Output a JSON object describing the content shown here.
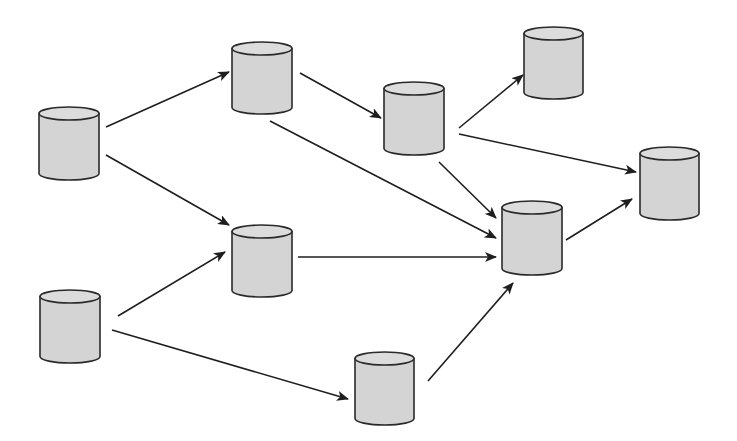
{
  "diagram": {
    "type": "directed-graph",
    "node_shape": "database-cylinder",
    "colors": {
      "background": "#ffffff",
      "fill": "#d4d4d4",
      "top_fill": "#dcdcdc",
      "stroke": "#2a2a2a",
      "edge": "#1e1e1e"
    },
    "nodes": [
      {
        "id": "n1",
        "x": 39,
        "y": 107,
        "w": 60,
        "h": 73
      },
      {
        "id": "n2",
        "x": 40,
        "y": 290,
        "w": 60,
        "h": 73
      },
      {
        "id": "n3",
        "x": 232,
        "y": 42,
        "w": 60,
        "h": 72
      },
      {
        "id": "n4",
        "x": 232,
        "y": 225,
        "w": 60,
        "h": 72
      },
      {
        "id": "n5",
        "x": 384,
        "y": 82,
        "w": 60,
        "h": 73
      },
      {
        "id": "n6",
        "x": 355,
        "y": 352,
        "w": 59,
        "h": 73
      },
      {
        "id": "n7",
        "x": 524,
        "y": 27,
        "w": 59,
        "h": 72
      },
      {
        "id": "n8",
        "x": 502,
        "y": 201,
        "w": 60,
        "h": 74
      },
      {
        "id": "n9",
        "x": 640,
        "y": 147,
        "w": 59,
        "h": 73
      }
    ],
    "edges": [
      {
        "from": "n1",
        "to": "n3",
        "x1": 106,
        "y1": 127,
        "x2": 229,
        "y2": 72
      },
      {
        "from": "n1",
        "to": "n4",
        "x1": 106,
        "y1": 155,
        "x2": 229,
        "y2": 225
      },
      {
        "from": "n2",
        "to": "n4",
        "x1": 118,
        "y1": 316,
        "x2": 225,
        "y2": 252
      },
      {
        "from": "n2",
        "to": "n6",
        "x1": 112,
        "y1": 330,
        "x2": 348,
        "y2": 399
      },
      {
        "from": "n3",
        "to": "n5",
        "x1": 300,
        "y1": 73,
        "x2": 381,
        "y2": 118
      },
      {
        "from": "n3",
        "to": "n8",
        "x1": 270,
        "y1": 121,
        "x2": 496,
        "y2": 238
      },
      {
        "from": "n4",
        "to": "n8",
        "x1": 298,
        "y1": 257,
        "x2": 496,
        "y2": 257
      },
      {
        "from": "n5",
        "to": "n7",
        "x1": 459,
        "y1": 128,
        "x2": 523,
        "y2": 75
      },
      {
        "from": "n5",
        "to": "n9",
        "x1": 459,
        "y1": 134,
        "x2": 636,
        "y2": 172
      },
      {
        "from": "n5",
        "to": "n8",
        "x1": 439,
        "y1": 162,
        "x2": 496,
        "y2": 218
      },
      {
        "from": "n6",
        "to": "n8",
        "x1": 428,
        "y1": 381,
        "x2": 513,
        "y2": 283
      },
      {
        "from": "n8",
        "to": "n9",
        "x1": 566,
        "y1": 240,
        "x2": 632,
        "y2": 199
      }
    ]
  }
}
